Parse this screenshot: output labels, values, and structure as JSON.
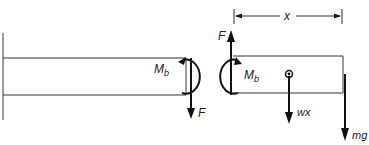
{
  "diagram": {
    "type": "free-body-diagram",
    "labels": {
      "moment_left": "M",
      "moment_left_sub": "b",
      "moment_right": "M",
      "moment_right_sub": "b",
      "shear_down": "F",
      "shear_up": "F",
      "distributed_load": "wx",
      "end_load": "mg",
      "dimension": "x"
    },
    "elements": [
      {
        "id": "wall",
        "kind": "support",
        "desc": "fixed wall at left"
      },
      {
        "id": "left-segment",
        "kind": "beam-section"
      },
      {
        "id": "right-segment",
        "kind": "beam-section"
      },
      {
        "id": "moment-left",
        "kind": "couple",
        "label": "Mb"
      },
      {
        "id": "moment-right",
        "kind": "couple",
        "label": "Mb"
      },
      {
        "id": "force-down",
        "kind": "force",
        "label": "F",
        "direction": "down"
      },
      {
        "id": "force-up",
        "kind": "force",
        "label": "F",
        "direction": "up"
      },
      {
        "id": "weight-wx",
        "kind": "force",
        "label": "wx",
        "direction": "down"
      },
      {
        "id": "load-mg",
        "kind": "force",
        "label": "mg",
        "direction": "down"
      },
      {
        "id": "dimension-x",
        "kind": "dimension",
        "label": "x"
      }
    ],
    "colors": {
      "stroke": "#2a2a2a",
      "text": "#222222",
      "background": "#ffffff"
    }
  }
}
